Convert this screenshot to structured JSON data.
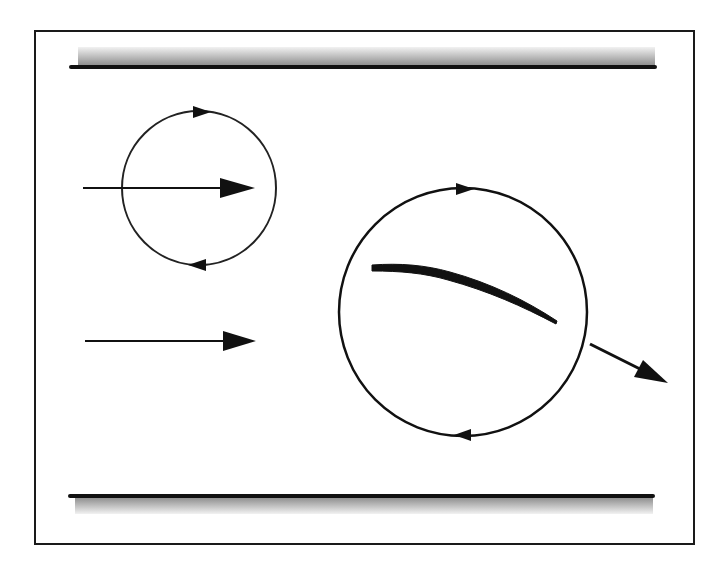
{
  "diagram": {
    "type": "physics-schematic",
    "colors": {
      "background": "#ffffff",
      "stroke": "#111111",
      "frame": "#1a1a1a",
      "wall_gradient_dark": "#8a8a8a",
      "wall_gradient_light": "#f2f2f2"
    },
    "frame": {
      "x": 35,
      "y": 31,
      "width": 659,
      "height": 513
    },
    "walls": [
      {
        "name": "top-wall",
        "line_y": 67,
        "x1": 71,
        "x2": 655,
        "shade_side": "above"
      },
      {
        "name": "bottom-wall",
        "line_y": 496,
        "x1": 70,
        "x2": 653,
        "shade_side": "below"
      }
    ],
    "elements": {
      "small_circle": {
        "cx": 199,
        "cy": 188,
        "r": 77,
        "circulation": "clockwise"
      },
      "large_circle": {
        "cx": 463,
        "cy": 312,
        "r": 124,
        "circulation": "clockwise"
      },
      "upper_flow_arrow": {
        "x1": 83,
        "y1": 188,
        "x2": 255,
        "y2": 188
      },
      "lower_flow_arrow": {
        "x1": 85,
        "y1": 341,
        "x2": 256,
        "y2": 341
      },
      "airfoil": {
        "start": [
          372,
          267
        ],
        "end": [
          557,
          322
        ]
      },
      "force_arrow": {
        "x1": 590,
        "y1": 344,
        "x2": 668,
        "y2": 383
      }
    }
  }
}
